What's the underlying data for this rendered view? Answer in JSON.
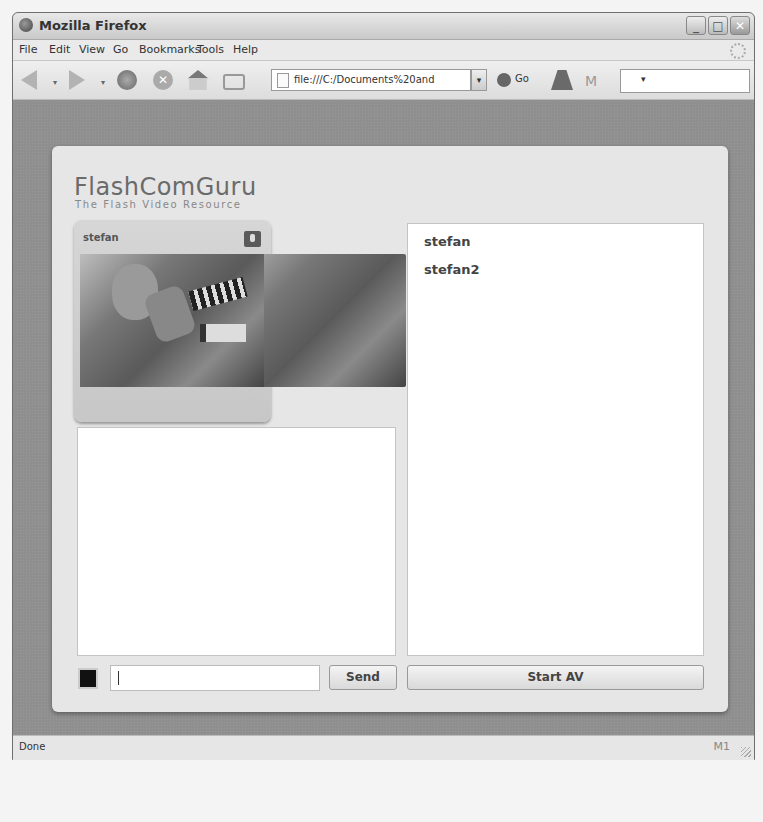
{
  "window": {
    "title": "Mozilla Firefox",
    "controls": {
      "minimize": "_",
      "maximize": "□",
      "close": "✕"
    }
  },
  "menubar": {
    "items": [
      "File",
      "Edit",
      "View",
      "Go",
      "Bookmarks",
      "Tools",
      "Help"
    ]
  },
  "toolbar": {
    "url": "file:///C:/Documents%20and",
    "go_label": "Go",
    "dropdown_glyph": "▾",
    "search_value": ""
  },
  "app": {
    "logo_title": "FlashComGuru",
    "logo_tagline": "The Flash Video Resource",
    "webcam": {
      "username": "stefan"
    },
    "users": [
      "stefan",
      "stefan2"
    ],
    "chat": {
      "message_value": "",
      "swatch_color": "#111111",
      "send_label": "Send"
    },
    "start_av_label": "Start AV"
  },
  "statusbar": {
    "status": "Done",
    "mail_indicator": "M1"
  }
}
